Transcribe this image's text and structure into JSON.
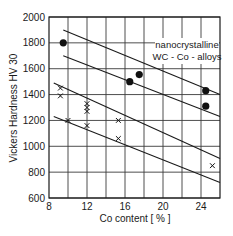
{
  "chart_data": {
    "type": "scatter",
    "title": "",
    "xlabel": "Co content  [ % ]",
    "ylabel": "Vickers Hardness HV 30",
    "xlim": [
      8,
      26
    ],
    "ylim": [
      600,
      2000
    ],
    "x_ticks": [
      8,
      12,
      16,
      20,
      24
    ],
    "y_ticks": [
      600,
      800,
      1000,
      1200,
      1400,
      1600,
      1800,
      2000
    ],
    "x_gridlines": [
      10,
      12,
      14,
      16,
      18,
      20,
      22,
      24
    ],
    "grid": true,
    "annotation": [
      "nanocrystalline",
      "WC - Co - alloys"
    ],
    "series": [
      {
        "name": "nanocrystalline WC-Co (filled circles)",
        "marker": "filled-circle",
        "points": [
          {
            "x": 9.5,
            "y": 1800
          },
          {
            "x": 16.5,
            "y": 1500
          },
          {
            "x": 17.5,
            "y": 1555
          },
          {
            "x": 24.5,
            "y": 1430
          },
          {
            "x": 24.5,
            "y": 1310
          }
        ]
      },
      {
        "name": "conventional WC-Co (crosses)",
        "marker": "cross",
        "points": [
          {
            "x": 9.2,
            "y": 1450
          },
          {
            "x": 9.2,
            "y": 1390
          },
          {
            "x": 10,
            "y": 1200
          },
          {
            "x": 12,
            "y": 1330
          },
          {
            "x": 12,
            "y": 1300
          },
          {
            "x": 12,
            "y": 1270
          },
          {
            "x": 12,
            "y": 1160
          },
          {
            "x": 15.3,
            "y": 1200
          },
          {
            "x": 15.3,
            "y": 1060
          },
          {
            "x": 25.2,
            "y": 850
          }
        ]
      }
    ],
    "band_lines": [
      {
        "name": "nanocrystalline-upper-bound",
        "x1": 9.5,
        "y1": 1900,
        "x2": 26,
        "y2": 1400
      },
      {
        "name": "nanocrystalline-lower-bound",
        "x1": 9.5,
        "y1": 1700,
        "x2": 26,
        "y2": 1230
      },
      {
        "name": "conventional-upper-bound",
        "x1": 8.5,
        "y1": 1490,
        "x2": 26,
        "y2": 905
      },
      {
        "name": "conventional-lower-bound",
        "x1": 8.5,
        "y1": 1230,
        "x2": 26,
        "y2": 720
      }
    ]
  }
}
